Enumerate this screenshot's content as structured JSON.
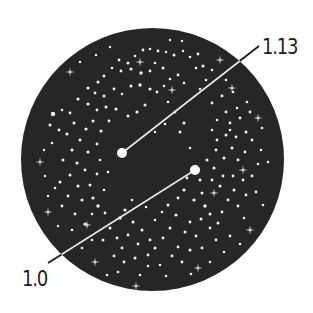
{
  "diagram": {
    "background": "#ffffff",
    "disc": {
      "cx": 152.5,
      "cy": 159.5,
      "r": 131.5,
      "fill": "#262626"
    },
    "star_color": "#f2f2f2",
    "callouts": [
      {
        "label": "1.13",
        "dot": {
          "x": 122,
          "y": 153,
          "r": 5
        },
        "line_end": {
          "x": 259,
          "y": 46
        },
        "label_pos": {
          "x": 262,
          "y": 36
        }
      },
      {
        "label": "1.0",
        "dot": {
          "x": 195,
          "y": 170,
          "r": 5
        },
        "line_end": {
          "x": 48,
          "y": 263
        },
        "label_pos": {
          "x": 22,
          "y": 268
        }
      }
    ],
    "sparkles": [
      [
        140,
        62
      ],
      [
        220,
        60
      ],
      [
        258,
        118
      ],
      [
        40,
        162
      ],
      [
        48,
        212
      ],
      [
        95,
        262
      ],
      [
        243,
        170
      ],
      [
        214,
        193
      ],
      [
        250,
        230
      ],
      [
        136,
        286
      ],
      [
        198,
        268
      ],
      [
        232,
        88
      ],
      [
        70,
        72
      ],
      [
        172,
        90
      ],
      [
        87,
        225
      ]
    ],
    "stars": [
      [
        143,
        50,
        1.4
      ],
      [
        150,
        49,
        1.3
      ],
      [
        158,
        51,
        1.4
      ],
      [
        166,
        52,
        1.2
      ],
      [
        174,
        55,
        1.5
      ],
      [
        183,
        51,
        1.2
      ],
      [
        190,
        57,
        1.3
      ],
      [
        198,
        54,
        1.4
      ],
      [
        203,
        66,
        1.6
      ],
      [
        196,
        68,
        1.3
      ],
      [
        212,
        70,
        1.3
      ],
      [
        119,
        60,
        1.4
      ],
      [
        128,
        63,
        1.5
      ],
      [
        135,
        56,
        1.3
      ],
      [
        112,
        68,
        1.3
      ],
      [
        121,
        71,
        1.4
      ],
      [
        131,
        69,
        1.6
      ],
      [
        141,
        73,
        1.7
      ],
      [
        150,
        71,
        1.4
      ],
      [
        155,
        63,
        1.3
      ],
      [
        163,
        68,
        1.5
      ],
      [
        170,
        79,
        1.3
      ],
      [
        178,
        75,
        1.4
      ],
      [
        184,
        83,
        1.3
      ],
      [
        104,
        76,
        1.4
      ],
      [
        98,
        82,
        1.5
      ],
      [
        88,
        88,
        1.6
      ],
      [
        95,
        93,
        1.4
      ],
      [
        104,
        96,
        1.5
      ],
      [
        114,
        89,
        1.4
      ],
      [
        122,
        94,
        1.3
      ],
      [
        131,
        86,
        1.5
      ],
      [
        140,
        85,
        1.7
      ],
      [
        150,
        89,
        1.6
      ],
      [
        157,
        92,
        1.4
      ],
      [
        164,
        86,
        1.3
      ],
      [
        145,
        105,
        1.5
      ],
      [
        137,
        112,
        1.6
      ],
      [
        128,
        116,
        1.5
      ],
      [
        116,
        109,
        1.6
      ],
      [
        106,
        107,
        1.5
      ],
      [
        97,
        110,
        1.4
      ],
      [
        88,
        104,
        1.6
      ],
      [
        78,
        99,
        1.6
      ],
      [
        70,
        113,
        1.4
      ],
      [
        62,
        110,
        1.3
      ],
      [
        74,
        123,
        1.5
      ],
      [
        67,
        134,
        1.6
      ],
      [
        59,
        130,
        1.4
      ],
      [
        80,
        140,
        1.5
      ],
      [
        86,
        129,
        1.6
      ],
      [
        93,
        121,
        1.5
      ],
      [
        101,
        131,
        1.5
      ],
      [
        109,
        121,
        1.4
      ],
      [
        97,
        144,
        1.4
      ],
      [
        88,
        152,
        1.6
      ],
      [
        72,
        150,
        1.5
      ],
      [
        63,
        160,
        1.5
      ],
      [
        53,
        114,
        2.2
      ],
      [
        50,
        125,
        1.5
      ],
      [
        52,
        143,
        1.3
      ],
      [
        77,
        163,
        1.5
      ],
      [
        85,
        170,
        1.4
      ],
      [
        70,
        175,
        1.5
      ],
      [
        60,
        182,
        1.5
      ],
      [
        78,
        186,
        1.6
      ],
      [
        90,
        185,
        1.5
      ],
      [
        97,
        174,
        1.4
      ],
      [
        68,
        196,
        1.4
      ],
      [
        82,
        200,
        1.5
      ],
      [
        93,
        198,
        1.6
      ],
      [
        98,
        206,
        1.7
      ],
      [
        105,
        213,
        1.4
      ],
      [
        92,
        214,
        1.3
      ],
      [
        62,
        206,
        1.4
      ],
      [
        55,
        188,
        1.3
      ],
      [
        75,
        214,
        1.4
      ],
      [
        85,
        224,
        1.5
      ],
      [
        110,
        228,
        1.5
      ],
      [
        120,
        218,
        1.7
      ],
      [
        125,
        210,
        1.6
      ],
      [
        133,
        222,
        1.5
      ],
      [
        103,
        240,
        1.5
      ],
      [
        117,
        238,
        1.4
      ],
      [
        128,
        235,
        1.4
      ],
      [
        142,
        230,
        1.5
      ],
      [
        138,
        244,
        1.4
      ],
      [
        150,
        240,
        1.4
      ],
      [
        122,
        248,
        1.4
      ],
      [
        114,
        256,
        1.4
      ],
      [
        124,
        262,
        1.4
      ],
      [
        135,
        258,
        1.5
      ],
      [
        148,
        255,
        1.4
      ],
      [
        155,
        248,
        1.5
      ],
      [
        163,
        238,
        1.4
      ],
      [
        170,
        228,
        1.5
      ],
      [
        176,
        215,
        1.6
      ],
      [
        168,
        205,
        1.5
      ],
      [
        178,
        198,
        1.4
      ],
      [
        184,
        190,
        1.6
      ],
      [
        194,
        200,
        1.6
      ],
      [
        202,
        193,
        1.5
      ],
      [
        205,
        206,
        1.7
      ],
      [
        210,
        214,
        1.5
      ],
      [
        201,
        219,
        1.5
      ],
      [
        190,
        222,
        1.4
      ],
      [
        185,
        232,
        1.5
      ],
      [
        196,
        236,
        1.4
      ],
      [
        210,
        228,
        1.4
      ],
      [
        218,
        223,
        1.5
      ],
      [
        222,
        212,
        1.4
      ],
      [
        228,
        200,
        1.4
      ],
      [
        238,
        206,
        1.4
      ],
      [
        244,
        218,
        1.3
      ],
      [
        230,
        236,
        1.4
      ],
      [
        216,
        240,
        1.4
      ],
      [
        202,
        248,
        1.4
      ],
      [
        190,
        250,
        1.5
      ],
      [
        178,
        247,
        1.4
      ],
      [
        172,
        256,
        1.4
      ],
      [
        182,
        262,
        1.4
      ],
      [
        160,
        265,
        1.3
      ],
      [
        148,
        266,
        1.3
      ],
      [
        207,
        160,
        1.5
      ],
      [
        216,
        150,
        1.4
      ],
      [
        224,
        158,
        1.5
      ],
      [
        232,
        148,
        1.5
      ],
      [
        238,
        160,
        1.4
      ],
      [
        245,
        152,
        1.4
      ],
      [
        252,
        140,
        1.4
      ],
      [
        246,
        132,
        1.5
      ],
      [
        236,
        137,
        1.4
      ],
      [
        226,
        135,
        1.5
      ],
      [
        217,
        140,
        1.4
      ],
      [
        212,
        130,
        1.3
      ],
      [
        230,
        123,
        1.4
      ],
      [
        240,
        118,
        1.4
      ],
      [
        250,
        112,
        1.4
      ],
      [
        247,
        102,
        1.3
      ],
      [
        237,
        108,
        1.3
      ],
      [
        226,
        112,
        1.4
      ],
      [
        217,
        120,
        1.3
      ],
      [
        212,
        103,
        1.4
      ],
      [
        222,
        96,
        1.4
      ],
      [
        233,
        92,
        1.3
      ],
      [
        214,
        168,
        1.5
      ],
      [
        223,
        176,
        1.4
      ],
      [
        233,
        176,
        1.4
      ],
      [
        243,
        180,
        1.4
      ],
      [
        252,
        176,
        1.4
      ],
      [
        258,
        164,
        1.3
      ],
      [
        261,
        150,
        1.3
      ],
      [
        256,
        192,
        1.4
      ],
      [
        246,
        195,
        1.4
      ],
      [
        234,
        190,
        1.5
      ],
      [
        220,
        186,
        1.5
      ],
      [
        212,
        180,
        1.4
      ],
      [
        200,
        180,
        1.5
      ],
      [
        187,
        178,
        1.4
      ],
      [
        180,
        132,
        1.5
      ],
      [
        184,
        123,
        1.6
      ],
      [
        175,
        112,
        1.4
      ],
      [
        168,
        102,
        1.3
      ],
      [
        190,
        148,
        1.3
      ],
      [
        262,
        128,
        1.3
      ],
      [
        268,
        162,
        1.3
      ],
      [
        263,
        205,
        1.3
      ],
      [
        108,
        172,
        1.3
      ],
      [
        104,
        190,
        1.3
      ],
      [
        146,
        207,
        1.3
      ],
      [
        155,
        220,
        1.3
      ],
      [
        162,
        212,
        1.3
      ],
      [
        132,
        200,
        1.3
      ],
      [
        72,
        230,
        1.3
      ],
      [
        92,
        240,
        1.3
      ],
      [
        82,
        248,
        1.3
      ],
      [
        107,
        275,
        1.3
      ],
      [
        118,
        272,
        1.3
      ],
      [
        140,
        275,
        1.3
      ],
      [
        166,
        276,
        1.3
      ],
      [
        191,
        274,
        1.3
      ],
      [
        210,
        262,
        1.3
      ],
      [
        224,
        252,
        1.3
      ],
      [
        240,
        244,
        1.3
      ],
      [
        44,
        150,
        1.2
      ],
      [
        45,
        176,
        1.2
      ],
      [
        48,
        196,
        1.2
      ],
      [
        58,
        226,
        1.2
      ],
      [
        165,
        124,
        1.3
      ],
      [
        155,
        132,
        1.2
      ],
      [
        100,
        160,
        1.3
      ],
      [
        200,
        89,
        1.3
      ],
      [
        206,
        80,
        1.3
      ],
      [
        226,
        80,
        1.3
      ],
      [
        110,
        47,
        1.2
      ],
      [
        96,
        55,
        1.2
      ],
      [
        80,
        62,
        1.2
      ],
      [
        182,
        41,
        1.2
      ],
      [
        170,
        40,
        1.2
      ],
      [
        230,
        130,
        1.3
      ]
    ]
  }
}
